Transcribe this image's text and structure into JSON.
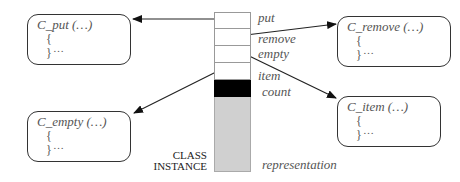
{
  "diagram": {
    "instance_label": {
      "line1": "CLASS",
      "line2": "INSTANCE"
    },
    "instance_fields": [
      {
        "name": "put",
        "kind": "routine-pointer",
        "fill": "#ffffff"
      },
      {
        "name": "remove",
        "kind": "routine-pointer",
        "fill": "#ffffff"
      },
      {
        "name": "empty",
        "kind": "routine-pointer",
        "fill": "#ffffff"
      },
      {
        "name": "item",
        "kind": "routine-pointer",
        "fill": "#ffffff"
      },
      {
        "name": "count",
        "kind": "attribute",
        "fill": "#000000"
      },
      {
        "name": "representation",
        "kind": "attribute",
        "fill": "#d0d0d0"
      }
    ],
    "routines": [
      {
        "signature": "C_put (…)",
        "open_brace": "{",
        "close_brace": "}",
        "body": "…"
      },
      {
        "signature": "C_remove (…)",
        "open_brace": "{",
        "close_brace": "}",
        "body": "…"
      },
      {
        "signature": "C_empty (…)",
        "open_brace": "{",
        "close_brace": "}",
        "body": "…"
      },
      {
        "signature": "C_item (…)",
        "open_brace": "{",
        "close_brace": "}",
        "body": "…"
      }
    ],
    "arrows": [
      {
        "from": "put",
        "to": "C_put (…)"
      },
      {
        "from": "remove",
        "to": "C_remove (…)"
      },
      {
        "from": "empty",
        "to": "C_item (…)"
      },
      {
        "from": "item",
        "to": "C_empty (…)"
      }
    ]
  }
}
